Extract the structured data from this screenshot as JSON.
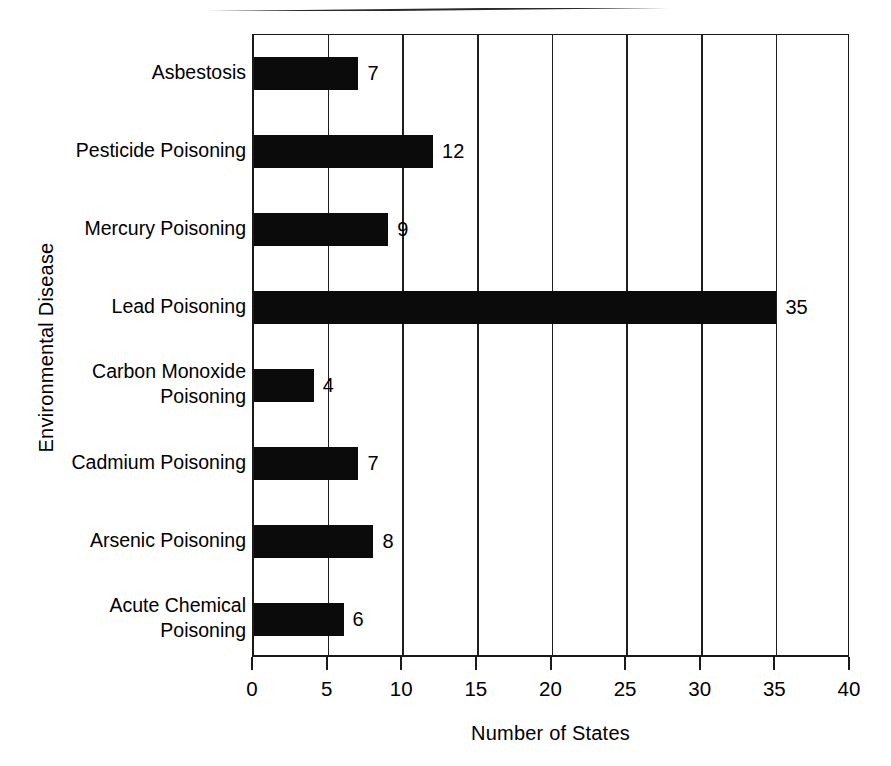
{
  "chart_data": {
    "type": "bar",
    "orientation": "horizontal",
    "title": "",
    "xlabel": "Number of States",
    "ylabel": "Environmental Disease",
    "categories": [
      "Asbestosis",
      "Pesticide Poisoning",
      "Mercury Poisoning",
      "Lead Poisoning",
      "Carbon Monoxide\nPoisoning",
      "Cadmium Poisoning",
      "Arsenic Poisoning",
      "Acute Chemical\nPoisoning"
    ],
    "values": [
      7,
      12,
      9,
      35,
      4,
      7,
      8,
      6
    ],
    "value_labels": [
      "7",
      "12",
      "9",
      "35",
      "4",
      "7",
      "8",
      "6"
    ],
    "xlim": [
      0,
      40
    ],
    "xticks": [
      0,
      5,
      10,
      15,
      20,
      25,
      30,
      35,
      40
    ],
    "xtick_labels": [
      "0",
      "5",
      "10",
      "15",
      "20",
      "25",
      "30",
      "35",
      "40"
    ],
    "grid": "vertical",
    "legend": "none",
    "bar_color": "#0b0b0b",
    "axis_color": "#1a1a1a",
    "background": "#ffffff"
  },
  "figure": {
    "bottom_caption": ""
  }
}
